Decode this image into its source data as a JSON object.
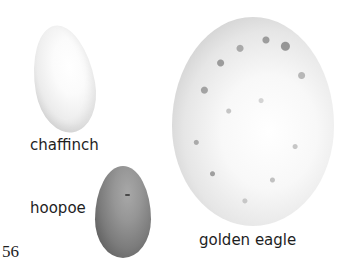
{
  "page": {
    "page_number": "56"
  },
  "eggs": [
    {
      "id": "chaffinch",
      "label": "chaffinch",
      "color": "#f4f4f4"
    },
    {
      "id": "hoopoe",
      "label": "hoopoe",
      "color": "#7c7c7c"
    },
    {
      "id": "golden-eagle",
      "label": "golden eagle",
      "color": "#ececec"
    }
  ]
}
